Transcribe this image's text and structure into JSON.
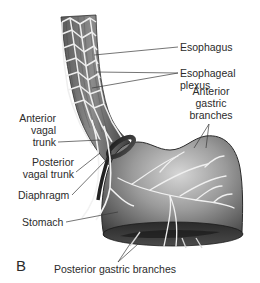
{
  "figure": {
    "panel_letter": "B",
    "labels": {
      "esophagus": "Esophagus",
      "esophageal_plexus_line1": "Esophageal",
      "esophageal_plexus_line2": "plexus",
      "anterior_vagal_trunk_line1": "Anterior",
      "anterior_vagal_trunk_line2": "vagal",
      "anterior_vagal_trunk_line3": "trunk",
      "posterior_vagal_trunk_line1": "Posterior",
      "posterior_vagal_trunk_line2": "vagal trunk",
      "diaphragm": "Diaphragm",
      "stomach": "Stomach",
      "anterior_gastric_branches_line1": "Anterior",
      "anterior_gastric_branches_line2": "gastric",
      "anterior_gastric_branches_line3": "branches",
      "posterior_gastric_branches": "Posterior gastric branches"
    },
    "colors": {
      "text": "#2b2b2b",
      "leader_line": "#3a3a3a",
      "tissue_dark": "#4a4a4a",
      "tissue_mid": "#7a7a7a",
      "tissue_light": "#bdbdbd",
      "nerve": "#e8e8e8",
      "background": "#ffffff"
    }
  }
}
